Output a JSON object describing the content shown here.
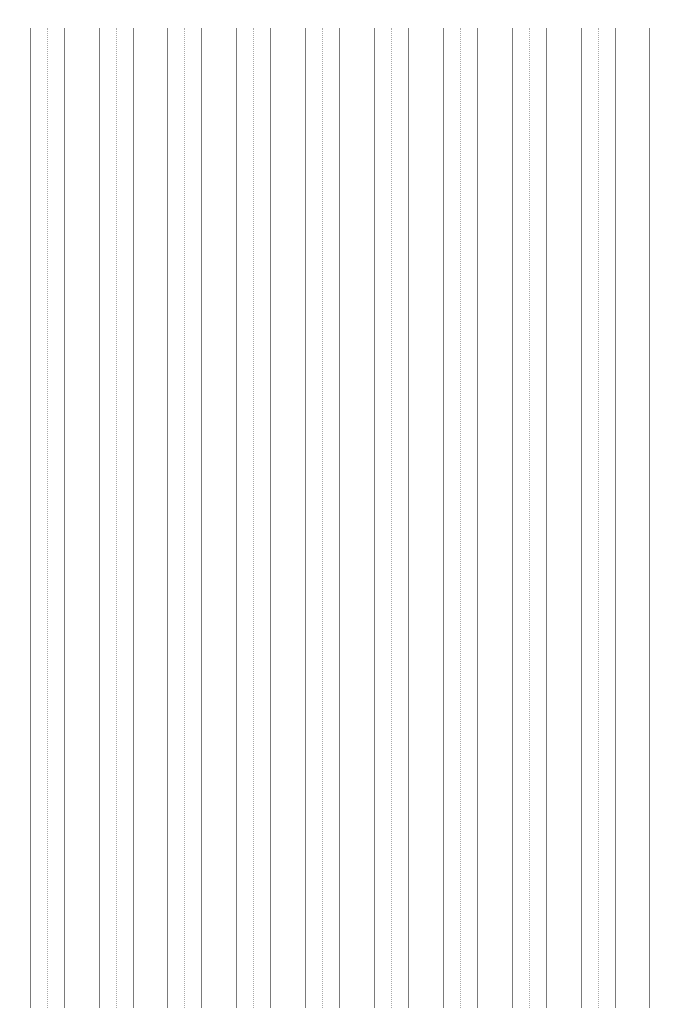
{
  "page": {
    "width": 680,
    "height": 1016,
    "background_color": "#ffffff"
  },
  "pattern": {
    "description": "Repeating groups of three vertical rules: solid, dotted, solid",
    "group_count": 9,
    "rules_per_group": 3,
    "total_rules": 27,
    "group_pitch_px": 77,
    "first_group_x_px": 30,
    "line_top_px": 28,
    "line_bottom_px": 1008,
    "line_height_px": 980,
    "solid_color": "#7a7a7a",
    "dotted_color": "#a8a8a8",
    "solid_width_px": 1.4,
    "dotted_width_px": 1.2,
    "intra_group_offsets_px": [
      0,
      17,
      34
    ]
  },
  "rules": [
    {
      "id": "rule-1",
      "group": 1,
      "index_in_group": 1,
      "style": "solid",
      "x": 30,
      "color": "#7a7a7a",
      "width": 1.4
    },
    {
      "id": "rule-2",
      "group": 1,
      "index_in_group": 2,
      "style": "dotted",
      "x": 47,
      "color": "#a8a8a8",
      "width": 1.2
    },
    {
      "id": "rule-3",
      "group": 1,
      "index_in_group": 3,
      "style": "solid",
      "x": 64,
      "color": "#7a7a7a",
      "width": 1.4
    },
    {
      "id": "rule-4",
      "group": 2,
      "index_in_group": 1,
      "style": "solid",
      "x": 99,
      "color": "#7a7a7a",
      "width": 1.4
    },
    {
      "id": "rule-5",
      "group": 2,
      "index_in_group": 2,
      "style": "dotted",
      "x": 116,
      "color": "#a8a8a8",
      "width": 1.2
    },
    {
      "id": "rule-6",
      "group": 2,
      "index_in_group": 3,
      "style": "solid",
      "x": 133,
      "color": "#7a7a7a",
      "width": 1.4
    },
    {
      "id": "rule-7",
      "group": 3,
      "index_in_group": 1,
      "style": "solid",
      "x": 167,
      "color": "#7a7a7a",
      "width": 1.4
    },
    {
      "id": "rule-8",
      "group": 3,
      "index_in_group": 2,
      "style": "dotted",
      "x": 184,
      "color": "#a8a8a8",
      "width": 1.2
    },
    {
      "id": "rule-9",
      "group": 3,
      "index_in_group": 3,
      "style": "solid",
      "x": 201,
      "color": "#7a7a7a",
      "width": 1.4
    },
    {
      "id": "rule-10",
      "group": 4,
      "index_in_group": 1,
      "style": "solid",
      "x": 236,
      "color": "#7a7a7a",
      "width": 1.4
    },
    {
      "id": "rule-11",
      "group": 4,
      "index_in_group": 2,
      "style": "dotted",
      "x": 253,
      "color": "#a8a8a8",
      "width": 1.2
    },
    {
      "id": "rule-12",
      "group": 4,
      "index_in_group": 3,
      "style": "solid",
      "x": 270,
      "color": "#7a7a7a",
      "width": 1.4
    },
    {
      "id": "rule-13",
      "group": 5,
      "index_in_group": 1,
      "style": "solid",
      "x": 305,
      "color": "#7a7a7a",
      "width": 1.4
    },
    {
      "id": "rule-14",
      "group": 5,
      "index_in_group": 2,
      "style": "dotted",
      "x": 322,
      "color": "#a8a8a8",
      "width": 1.2
    },
    {
      "id": "rule-15",
      "group": 5,
      "index_in_group": 3,
      "style": "solid",
      "x": 339,
      "color": "#7a7a7a",
      "width": 1.4
    },
    {
      "id": "rule-16",
      "group": 6,
      "index_in_group": 1,
      "style": "solid",
      "x": 374,
      "color": "#7a7a7a",
      "width": 1.4
    },
    {
      "id": "rule-17",
      "group": 6,
      "index_in_group": 2,
      "style": "dotted",
      "x": 391,
      "color": "#a8a8a8",
      "width": 1.2
    },
    {
      "id": "rule-18",
      "group": 6,
      "index_in_group": 3,
      "style": "solid",
      "x": 408,
      "color": "#7a7a7a",
      "width": 1.4
    },
    {
      "id": "rule-19",
      "group": 7,
      "index_in_group": 1,
      "style": "solid",
      "x": 443,
      "color": "#7a7a7a",
      "width": 1.4
    },
    {
      "id": "rule-20",
      "group": 7,
      "index_in_group": 2,
      "style": "dotted",
      "x": 460,
      "color": "#a8a8a8",
      "width": 1.2
    },
    {
      "id": "rule-21",
      "group": 7,
      "index_in_group": 3,
      "style": "solid",
      "x": 477,
      "color": "#7a7a7a",
      "width": 1.4
    },
    {
      "id": "rule-22",
      "group": 8,
      "index_in_group": 1,
      "style": "solid",
      "x": 512,
      "color": "#7a7a7a",
      "width": 1.4
    },
    {
      "id": "rule-23",
      "group": 8,
      "index_in_group": 2,
      "style": "dotted",
      "x": 529,
      "color": "#a8a8a8",
      "width": 1.2
    },
    {
      "id": "rule-24",
      "group": 8,
      "index_in_group": 3,
      "style": "solid",
      "x": 546,
      "color": "#7a7a7a",
      "width": 1.4
    },
    {
      "id": "rule-25",
      "group": 9,
      "index_in_group": 1,
      "style": "solid",
      "x": 581,
      "color": "#7a7a7a",
      "width": 1.4
    },
    {
      "id": "rule-26",
      "group": 9,
      "index_in_group": 2,
      "style": "dotted",
      "x": 598,
      "color": "#a8a8a8",
      "width": 1.2
    },
    {
      "id": "rule-27",
      "group": 9,
      "index_in_group": 3,
      "style": "solid",
      "x": 615,
      "color": "#7a7a7a",
      "width": 1.4
    },
    {
      "id": "rule-28",
      "group": 10,
      "index_in_group": 1,
      "style": "solid",
      "x": 649,
      "color": "#7a7a7a",
      "width": 1.4
    }
  ]
}
